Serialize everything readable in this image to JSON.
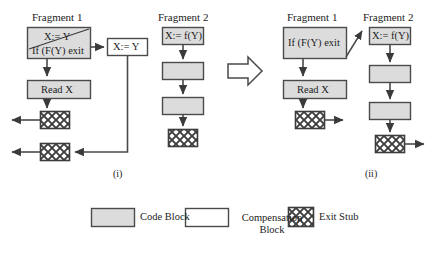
{
  "figure": {
    "type": "flow-diagram",
    "panels": [
      {
        "id": "panel-i",
        "label": "(i)",
        "fragments": [
          {
            "title": "Fragment 1",
            "nodes": [
              {
                "kind": "code-block",
                "text": "X:= Y",
                "struck": true,
                "second_line": "If (F(Y) exit"
              },
              {
                "kind": "code-block",
                "text": "Read X"
              },
              {
                "kind": "exit-stub",
                "text": ""
              },
              {
                "kind": "exit-stub",
                "text": ""
              }
            ],
            "compensation": {
              "kind": "compensation-block",
              "text": "X:= Y"
            }
          },
          {
            "title": "Fragment 2",
            "nodes": [
              {
                "kind": "code-block",
                "text": "X:= f(Y)"
              },
              {
                "kind": "code-block",
                "text": ""
              },
              {
                "kind": "code-block",
                "text": ""
              },
              {
                "kind": "exit-stub",
                "text": ""
              }
            ]
          }
        ]
      },
      {
        "id": "panel-ii",
        "label": "(ii)",
        "fragments": [
          {
            "title": "Fragment 1",
            "nodes": [
              {
                "kind": "code-block",
                "text": "If (F(Y) exit"
              },
              {
                "kind": "code-block",
                "text": "Read X"
              },
              {
                "kind": "exit-stub",
                "text": ""
              }
            ]
          },
          {
            "title": "Fragment 2",
            "nodes": [
              {
                "kind": "code-block",
                "text": "X:= f(Y)"
              },
              {
                "kind": "code-block",
                "text": ""
              },
              {
                "kind": "code-block",
                "text": ""
              },
              {
                "kind": "exit-stub",
                "text": ""
              }
            ]
          }
        ]
      }
    ],
    "transform_arrow": "rightwards-block-arrow"
  },
  "legend": {
    "items": [
      {
        "swatch": "code-block",
        "label": "Code Block"
      },
      {
        "swatch": "compensation-block",
        "label": "Compensation Block"
      },
      {
        "swatch": "exit-stub",
        "label": "Exit Stub"
      }
    ]
  },
  "colors": {
    "code_block_fill": "#dcdcdc",
    "compensation_block_fill": "#ffffff",
    "stroke": "#4a4a4a",
    "text": "#222222",
    "background": "#ffffff"
  }
}
